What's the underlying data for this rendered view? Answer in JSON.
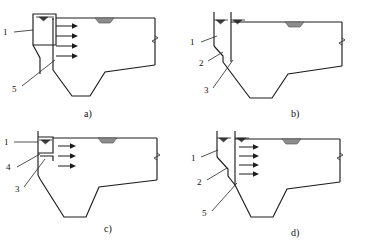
{
  "figure": {
    "background_color": "#ffffff",
    "line_color": "#1c1c1c",
    "mound_color": "#8d8d8d",
    "panel_count": 4,
    "layout": "2x2 grid"
  },
  "panels": [
    {
      "id": "a",
      "caption": "a)",
      "description": "Dam cross-section with intake tower, four horizontal flow arrows and inclined sediment line",
      "arrow_count": 4,
      "arrow_labels": [
        "flow-arrow-1",
        "flow-arrow-2",
        "flow-arrow-3",
        "flow-arrow-4"
      ],
      "water_level_markers": 1,
      "callouts": [
        {
          "label": "1",
          "name": "callout-1",
          "position": "left"
        },
        {
          "label": "5",
          "name": "callout-5",
          "position": "lower-left"
        }
      ]
    },
    {
      "id": "b",
      "caption": "b)",
      "description": "Dam cross-section with twin vertical intake walls, no flow arrows",
      "arrow_count": 0,
      "arrow_labels": [],
      "water_level_markers": 2,
      "callouts": [
        {
          "label": "1",
          "name": "callout-1",
          "position": "left"
        },
        {
          "label": "2",
          "name": "callout-2",
          "position": "lower-left"
        },
        {
          "label": "3",
          "name": "callout-3",
          "position": "lower-left"
        }
      ]
    },
    {
      "id": "c",
      "caption": "c)",
      "description": "Dam cross-section with compact intake box and three horizontal flow arrows",
      "arrow_count": 3,
      "arrow_labels": [
        "flow-arrow-1",
        "flow-arrow-2",
        "flow-arrow-3"
      ],
      "water_level_markers": 1,
      "callouts": [
        {
          "label": "1",
          "name": "callout-1",
          "position": "left"
        },
        {
          "label": "4",
          "name": "callout-4",
          "position": "left"
        },
        {
          "label": "3",
          "name": "callout-3",
          "position": "lower-left"
        }
      ]
    },
    {
      "id": "d",
      "caption": "d)",
      "description": "Dam cross-section with stepped intake wall and four horizontal flow arrows",
      "arrow_count": 4,
      "arrow_labels": [
        "flow-arrow-1",
        "flow-arrow-2",
        "flow-arrow-3",
        "flow-arrow-4"
      ],
      "water_level_markers": 2,
      "callouts": [
        {
          "label": "1",
          "name": "callout-1",
          "position": "left"
        },
        {
          "label": "2",
          "name": "callout-2",
          "position": "lower-left"
        },
        {
          "label": "5",
          "name": "callout-5",
          "position": "lower-left"
        }
      ]
    }
  ]
}
